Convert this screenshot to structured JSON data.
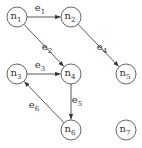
{
  "diagram": {
    "type": "directed-graph",
    "nodes": [
      {
        "id": "n1",
        "base": "n",
        "sub": "1",
        "x": 17,
        "y": 17
      },
      {
        "id": "n2",
        "base": "n",
        "sub": "2",
        "x": 71,
        "y": 17
      },
      {
        "id": "n3",
        "base": "n",
        "sub": "3",
        "x": 17,
        "y": 74
      },
      {
        "id": "n4",
        "base": "n",
        "sub": "4",
        "x": 71,
        "y": 74
      },
      {
        "id": "n5",
        "base": "n",
        "sub": "5",
        "x": 126,
        "y": 74
      },
      {
        "id": "n6",
        "base": "n",
        "sub": "6",
        "x": 71,
        "y": 130
      },
      {
        "id": "n7",
        "base": "n",
        "sub": "7",
        "x": 126,
        "y": 130
      }
    ],
    "edges": [
      {
        "id": "e1",
        "base": "e",
        "sub": "1",
        "from": "n1",
        "to": "n2",
        "lx": 40,
        "ly": 11
      },
      {
        "id": "e2",
        "base": "e",
        "sub": "2",
        "from": "n1",
        "to": "n4",
        "lx": 47,
        "ly": 50
      },
      {
        "id": "e3",
        "base": "e",
        "sub": "3",
        "from": "n3",
        "to": "n4",
        "lx": 40,
        "ly": 68
      },
      {
        "id": "e4",
        "base": "e",
        "sub": "4",
        "from": "n2",
        "to": "n5",
        "lx": 102,
        "ly": 50
      },
      {
        "id": "e5",
        "base": "e",
        "sub": "5",
        "from": "n4",
        "to": "n6",
        "lx": 77,
        "ly": 103
      },
      {
        "id": "e6",
        "base": "e",
        "sub": "6",
        "from": "n6",
        "to": "n3",
        "lx": 34,
        "ly": 108
      }
    ],
    "node_radius": 10,
    "colors": {
      "stroke": "#555555",
      "text": "#333333",
      "background": "#ffffff"
    }
  }
}
